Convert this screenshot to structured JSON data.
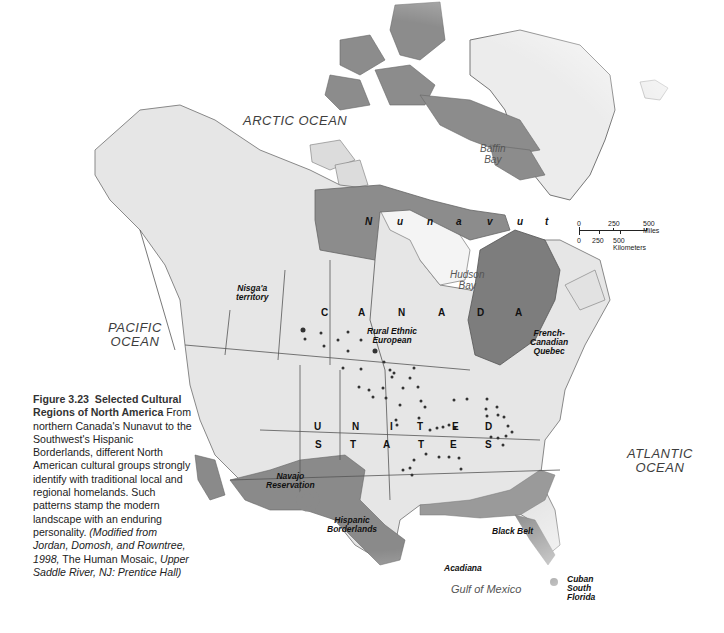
{
  "figure": {
    "number": "Figure 3.23",
    "title": "Selected Cultural Regions of North America",
    "body": "From northern Canada's Nunavut to the Southwest's Hispanic Borderlands, different North American cultural groups strongly identify with traditional local and regional homelands. Such patterns stamp the modern landscape with an enduring personality.",
    "source_prefix": "(Modified from Jordan, Domosh, and Rowntree, 1998,",
    "source_book": "The Human Mosaic,",
    "source_publisher": "Upper Saddle River, NJ: Prentice Hall)"
  },
  "oceans": {
    "arctic": "ARCTIC OCEAN",
    "pacific_line1": "PACIFIC",
    "pacific_line2": "OCEAN",
    "atlantic_line1": "ATLANTIC",
    "atlantic_line2": "OCEAN"
  },
  "water_bodies": {
    "baffin_line1": "Baffin",
    "baffin_line2": "Bay",
    "hudson_line1": "Hudson",
    "hudson_line2": "Bay",
    "gulf": "Gulf of Mexico"
  },
  "countries": {
    "canada_letters": [
      "C",
      "A",
      "N",
      "A",
      "D",
      "A"
    ],
    "us_row1": [
      "U",
      "N",
      "I",
      "T",
      "E",
      "D"
    ],
    "us_row2": [
      "S",
      "T",
      "A",
      "T",
      "E",
      "S"
    ],
    "nunavut_letters": [
      "N",
      "u",
      "n",
      "a",
      "v",
      "u",
      "t"
    ]
  },
  "regions": {
    "nisgaa_line1": "Nisga'a",
    "nisgaa_line2": "territory",
    "rural_line1": "Rural Ethnic",
    "rural_line2": "European",
    "french_line1": "French-",
    "french_line2": "Canadian",
    "french_line3": "Quebec",
    "navajo_line1": "Navajo",
    "navajo_line2": "Reservation",
    "hispanic_line1": "Hispanic",
    "hispanic_line2": "Borderlands",
    "black_belt": "Black Belt",
    "acadiana": "Acadiana",
    "cuban_line1": "Cuban",
    "cuban_line2": "South",
    "cuban_line3": "Florida"
  },
  "scale_bar": {
    "miles_ticks": [
      "0",
      "250",
      "500 Miles"
    ],
    "km_ticks": [
      "0",
      "250",
      "500 Kilometers"
    ]
  },
  "colors": {
    "land": "#e4e4e4",
    "region_fill": "#8a8a8a",
    "region_dark": "#6f6f6f",
    "water": "#ffffff",
    "border": "#555555"
  }
}
